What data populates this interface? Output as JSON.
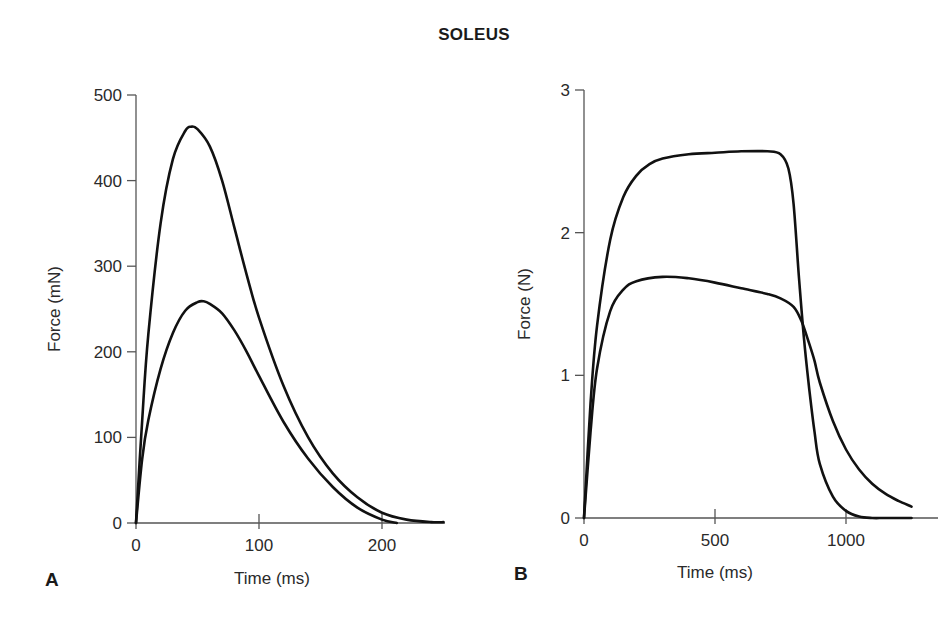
{
  "figure": {
    "title": "SOLEUS"
  },
  "chart_data": [
    {
      "panel": "A",
      "type": "line",
      "title": "",
      "xlabel": "Time (ms)",
      "ylabel": "Force (mN)",
      "xlim": [
        0,
        250
      ],
      "ylim": [
        0,
        500
      ],
      "xticks": [
        0,
        100,
        200
      ],
      "yticks": [
        0,
        100,
        200,
        300,
        400,
        500
      ],
      "grid": false,
      "legend": null,
      "series": [
        {
          "name": "upper twitch",
          "x": [
            0,
            5,
            10,
            20,
            30,
            40,
            45,
            50,
            60,
            70,
            80,
            90,
            100,
            120,
            140,
            160,
            180,
            200,
            220,
            240,
            250
          ],
          "y": [
            0,
            120,
            220,
            350,
            425,
            458,
            463,
            460,
            440,
            400,
            345,
            290,
            240,
            160,
            100,
            58,
            30,
            12,
            4,
            1,
            1
          ]
        },
        {
          "name": "lower twitch",
          "x": [
            0,
            5,
            10,
            20,
            30,
            40,
            50,
            55,
            60,
            70,
            80,
            90,
            100,
            120,
            140,
            160,
            180,
            200,
            212
          ],
          "y": [
            0,
            75,
            120,
            180,
            222,
            248,
            258,
            259,
            256,
            245,
            225,
            200,
            172,
            118,
            75,
            42,
            18,
            4,
            0
          ]
        }
      ]
    },
    {
      "panel": "B",
      "type": "line",
      "title": "",
      "xlabel": "Time (ms)",
      "ylabel": "Force (N)",
      "xlim": [
        0,
        1250
      ],
      "ylim": [
        0,
        3
      ],
      "xticks": [
        0,
        500,
        1000
      ],
      "yticks": [
        0,
        1,
        2,
        3
      ],
      "grid": false,
      "legend": null,
      "series": [
        {
          "name": "upper tetanus",
          "x": [
            0,
            25,
            50,
            100,
            150,
            200,
            250,
            300,
            400,
            500,
            600,
            700,
            750,
            780,
            800,
            820,
            840,
            860,
            880,
            900,
            950,
            1000,
            1050,
            1100,
            1150,
            1250
          ],
          "y": [
            0,
            0.8,
            1.35,
            1.95,
            2.25,
            2.4,
            2.48,
            2.52,
            2.55,
            2.56,
            2.57,
            2.57,
            2.55,
            2.45,
            2.2,
            1.7,
            1.25,
            0.9,
            0.6,
            0.38,
            0.15,
            0.05,
            0.01,
            0.0,
            0.0,
            0.0
          ]
        },
        {
          "name": "lower tetanus",
          "x": [
            0,
            25,
            50,
            100,
            150,
            200,
            300,
            400,
            500,
            600,
            700,
            750,
            800,
            830,
            860,
            880,
            900,
            950,
            1000,
            1050,
            1100,
            1150,
            1200,
            1250
          ],
          "y": [
            0,
            0.6,
            1.05,
            1.45,
            1.6,
            1.66,
            1.69,
            1.68,
            1.65,
            1.61,
            1.57,
            1.54,
            1.48,
            1.38,
            1.22,
            1.1,
            0.95,
            0.68,
            0.48,
            0.34,
            0.24,
            0.17,
            0.12,
            0.08
          ]
        }
      ]
    }
  ],
  "panels": {
    "A": {
      "label": "A",
      "xlabel": "Time (ms)",
      "ylabel": "Force (mN)",
      "xtick_labels": [
        "0",
        "100",
        "200"
      ],
      "ytick_labels": [
        "0",
        "100",
        "200",
        "300",
        "400",
        "500"
      ]
    },
    "B": {
      "label": "B",
      "xlabel": "Time (ms)",
      "ylabel": "Force (N)",
      "xtick_labels": [
        "0",
        "500",
        "1000"
      ],
      "ytick_labels": [
        "0",
        "1",
        "2",
        "3"
      ]
    }
  },
  "colors": {
    "curve": "#111111",
    "axis": "#555555",
    "text": "#2a2a2a"
  }
}
